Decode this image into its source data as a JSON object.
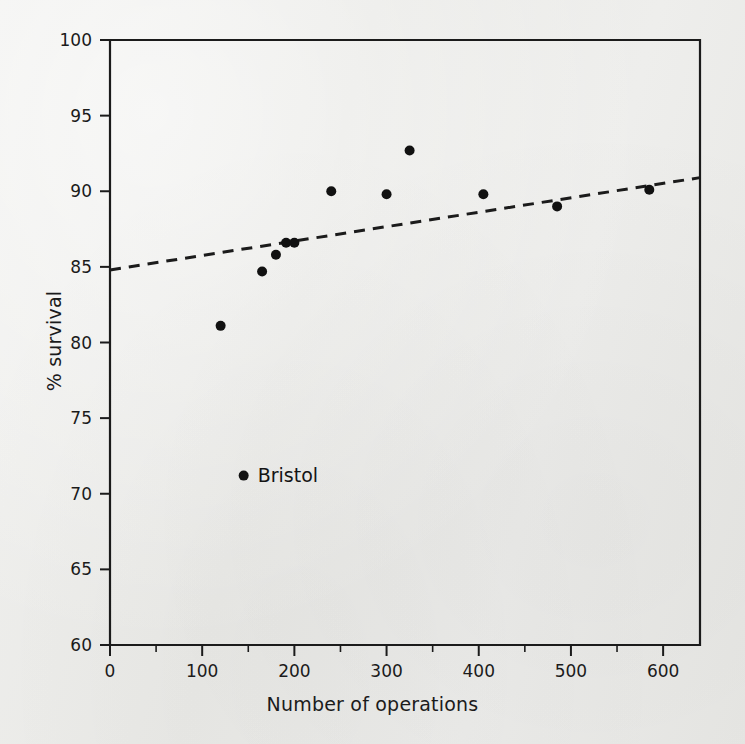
{
  "figure": {
    "background_color": "#ececea",
    "ink_color": "#1b1b1b"
  },
  "chart_data": {
    "type": "scatter",
    "title": "",
    "xlabel": "Number of operations",
    "ylabel": "% survival",
    "xlim": [
      0,
      640
    ],
    "ylim": [
      60,
      100
    ],
    "xticks": [
      0,
      100,
      200,
      300,
      400,
      500,
      600
    ],
    "xtick_labels": [
      "0",
      "100",
      "200",
      "300",
      "400",
      "500",
      "600"
    ],
    "x_minor_ticks": [
      50,
      150,
      250,
      350,
      450,
      550
    ],
    "yticks": [
      60,
      65,
      70,
      75,
      80,
      85,
      90,
      95,
      100
    ],
    "ytick_labels": [
      "60",
      "65",
      "70",
      "75",
      "80",
      "85",
      "90",
      "95",
      "100"
    ],
    "grid": false,
    "legend": null,
    "marker": {
      "shape": "circle",
      "color": "#111111",
      "size": 9
    },
    "points": [
      {
        "x": 120,
        "y": 81.1,
        "label": ""
      },
      {
        "x": 145,
        "y": 71.2,
        "label": "Bristol"
      },
      {
        "x": 165,
        "y": 84.7,
        "label": ""
      },
      {
        "x": 180,
        "y": 85.8,
        "label": ""
      },
      {
        "x": 191,
        "y": 86.6,
        "label": ""
      },
      {
        "x": 200,
        "y": 86.6,
        "label": ""
      },
      {
        "x": 240,
        "y": 90.0,
        "label": ""
      },
      {
        "x": 300,
        "y": 89.8,
        "label": ""
      },
      {
        "x": 325,
        "y": 92.7,
        "label": ""
      },
      {
        "x": 405,
        "y": 89.8,
        "label": ""
      },
      {
        "x": 485,
        "y": 89.0,
        "label": ""
      },
      {
        "x": 585,
        "y": 90.1,
        "label": ""
      }
    ],
    "annotations": [
      {
        "text": "Bristol",
        "x": 145,
        "y": 71.2,
        "placement": "right"
      }
    ],
    "trend_line": {
      "style": "dashed",
      "color": "#1b1b1b",
      "x_start": 0,
      "y_start": 84.8,
      "x_end": 640,
      "y_end": 90.9
    }
  }
}
